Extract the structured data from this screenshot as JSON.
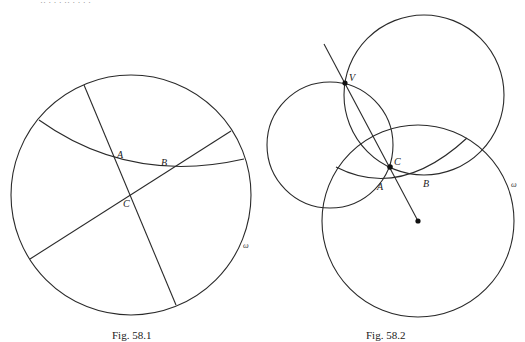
{
  "top_fragment": "·· ·   ·  · ··  ·   ·  ·  ·",
  "figures": [
    {
      "caption": "Fig. 58.1",
      "omega_label": "ω",
      "points": {
        "A": "A",
        "B": "B",
        "C": "C"
      }
    },
    {
      "caption": "Fig. 58.2",
      "omega_label": "ω",
      "points": {
        "V": "V",
        "C": "C",
        "A": "A",
        "B": "B"
      }
    }
  ],
  "colors": {
    "line": "#2a2a2a",
    "background": "#ffffff"
  }
}
